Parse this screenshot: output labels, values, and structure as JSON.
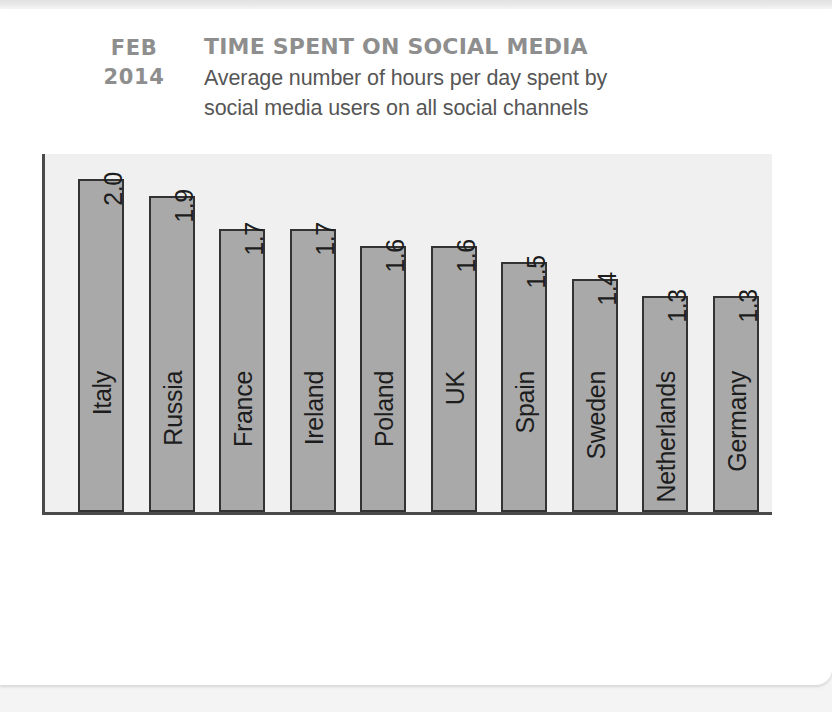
{
  "card": {
    "background_color": "#ffffff",
    "page_background_color": "#f4f4f4"
  },
  "header": {
    "date_month": "FEB",
    "date_year": "2014",
    "title": "TIME SPENT ON SOCIAL MEDIA",
    "subtitle_line1": "Average number of hours per day spent by",
    "subtitle_line2": "social media users on all social channels",
    "title_color": "#8e8e8e",
    "subtitle_color": "#565656"
  },
  "plot": {
    "background_color": "#f0f0f0",
    "axis_color": "#4a4a4a",
    "bar_fill_color": "#a9a9a9",
    "bar_stroke_color": "#333333",
    "label_color": "#1d1d1d"
  },
  "chart_data": {
    "type": "bar",
    "title": "TIME SPENT ON SOCIAL MEDIA",
    "subtitle": "Average number of hours per day spent by social media users on all social channels",
    "xlabel": "",
    "ylabel": "",
    "ylim": [
      0,
      2.15
    ],
    "grid": false,
    "legend": false,
    "value_labels_rotated": true,
    "categories": [
      "Italy",
      "Russia",
      "France",
      "Ireland",
      "Poland",
      "UK",
      "Spain",
      "Sweden",
      "Netherlands",
      "Germany"
    ],
    "values": [
      2.0,
      1.9,
      1.7,
      1.7,
      1.6,
      1.6,
      1.5,
      1.4,
      1.3,
      1.3
    ],
    "value_labels": [
      "2.0",
      "1.9",
      "1.7",
      "1.7",
      "1.6",
      "1.6",
      "1.5",
      "1.4",
      "1.3",
      "1.3"
    ],
    "units": "hours per day"
  }
}
